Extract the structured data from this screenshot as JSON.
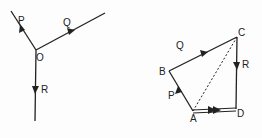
{
  "diagram": {
    "type": "vector force diagrams",
    "left": {
      "title": "concurrent forces at point O",
      "point_label": "O",
      "forces": [
        {
          "label": "P",
          "direction": "up-left"
        },
        {
          "label": "Q",
          "direction": "up-right"
        },
        {
          "label": "R",
          "direction": "down"
        }
      ]
    },
    "right": {
      "title": "polygon of forces",
      "vertices": [
        "A",
        "B",
        "C",
        "D"
      ],
      "edges": [
        {
          "from": "A",
          "to": "B",
          "label": "P",
          "style": "solid"
        },
        {
          "from": "B",
          "to": "C",
          "label": "Q",
          "style": "solid"
        },
        {
          "from": "C",
          "to": "D",
          "label": "R",
          "style": "solid"
        },
        {
          "from": "A",
          "to": "D",
          "label": "",
          "style": "double",
          "note": "resultant"
        },
        {
          "from": "A",
          "to": "C",
          "label": "",
          "style": "dashed"
        }
      ]
    }
  },
  "labels": {
    "O": "O",
    "P": "P",
    "Q": "Q",
    "R": "R",
    "A": "A",
    "B": "B",
    "C": "C",
    "D": "D"
  },
  "colors": {
    "ink": "#222222",
    "background": "#fdfdfd"
  }
}
